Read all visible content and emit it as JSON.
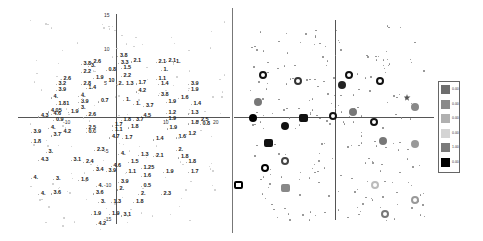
{
  "chart_data": [
    {
      "type": "scatter",
      "title": "",
      "xlabel": "",
      "ylabel": "",
      "xlim": [
        -20,
        22
      ],
      "ylim": [
        -17,
        17
      ],
      "grid": false,
      "x_ticks": [
        -10,
        10,
        20
      ],
      "y_ticks": [
        15,
        10,
        5,
        -5,
        -10,
        -15
      ],
      "points": [
        {
          "x": 0.8,
          "y": 15.5,
          "label": "3.8"
        },
        {
          "x": -6.5,
          "y": 13.5,
          "label": "3.8"
        },
        {
          "x": -4.5,
          "y": 14.0,
          "label": "2.6"
        },
        {
          "x": -5,
          "y": 13,
          "label": "3."
        },
        {
          "x": 1,
          "y": 13.8,
          "label": "3.3"
        },
        {
          "x": 3.5,
          "y": 14.2,
          "label": "2.1"
        },
        {
          "x": 8.5,
          "y": 14,
          "label": "2.1"
        },
        {
          "x": 10.5,
          "y": 14.3,
          "label": "2.1"
        },
        {
          "x": 12,
          "y": 14.1,
          "label": "1."
        },
        {
          "x": -6.5,
          "y": 11.5,
          "label": "2.2"
        },
        {
          "x": -1.5,
          "y": 12,
          "label": "0.8"
        },
        {
          "x": 1.5,
          "y": 12.5,
          "label": "1.5"
        },
        {
          "x": 9.5,
          "y": 12,
          "label": "1."
        },
        {
          "x": -10.5,
          "y": 9.8,
          "label": "2.6"
        },
        {
          "x": -4,
          "y": 10,
          "label": "1.9"
        },
        {
          "x": -1.5,
          "y": 9.3,
          "label": "10"
        },
        {
          "x": 1.5,
          "y": 10.5,
          "label": "2.2"
        },
        {
          "x": 8.5,
          "y": 9.8,
          "label": "1.1"
        },
        {
          "x": -11.5,
          "y": 8.5,
          "label": "3.2"
        },
        {
          "x": -6.5,
          "y": 8.5,
          "label": "2.8"
        },
        {
          "x": -5.5,
          "y": 7.5,
          "label": "1.4"
        },
        {
          "x": 0.5,
          "y": 8.6,
          "label": "2."
        },
        {
          "x": 2,
          "y": 8.5,
          "label": "1.3"
        },
        {
          "x": 4.5,
          "y": 8.7,
          "label": "1.7"
        },
        {
          "x": 9,
          "y": 8.5,
          "label": "1.4"
        },
        {
          "x": 15,
          "y": 8.5,
          "label": "3.9"
        },
        {
          "x": -11.5,
          "y": 7,
          "label": "3.9"
        },
        {
          "x": 4.5,
          "y": 6.7,
          "label": "4.2"
        },
        {
          "x": 15,
          "y": 7,
          "label": "1.9"
        },
        {
          "x": -12.5,
          "y": 5.2,
          "label": "4."
        },
        {
          "x": -7,
          "y": 5.5,
          "label": "4."
        },
        {
          "x": 9,
          "y": 5.8,
          "label": "3.8"
        },
        {
          "x": 13,
          "y": 5,
          "label": "1.6"
        },
        {
          "x": -11.5,
          "y": 3.5,
          "label": "1.81"
        },
        {
          "x": -7,
          "y": 4,
          "label": "3.9"
        },
        {
          "x": -3,
          "y": 4.2,
          "label": "0.7"
        },
        {
          "x": 2,
          "y": 4.5,
          "label": "1."
        },
        {
          "x": 4,
          "y": 3.5,
          "label": "1."
        },
        {
          "x": 6,
          "y": 3,
          "label": "3.7"
        },
        {
          "x": 10.5,
          "y": 4,
          "label": "1.9"
        },
        {
          "x": 15.5,
          "y": 3.5,
          "label": "1.4"
        },
        {
          "x": -7,
          "y": 2.5,
          "label": "3."
        },
        {
          "x": -13,
          "y": 1.7,
          "label": "4.05"
        },
        {
          "x": -9,
          "y": 1.5,
          "label": "1.9"
        },
        {
          "x": -12.5,
          "y": 1.0,
          "label": "4.6"
        },
        {
          "x": -5.5,
          "y": 0.8,
          "label": "2.6"
        },
        {
          "x": 5.5,
          "y": 0.5,
          "label": "4.5"
        },
        {
          "x": 10.5,
          "y": 1.3,
          "label": "1.2"
        },
        {
          "x": 15,
          "y": 1.2,
          "label": "1.3"
        },
        {
          "x": -15,
          "y": 0.4,
          "label": "4.3"
        },
        {
          "x": -12,
          "y": -0.5,
          "label": "0.9"
        },
        {
          "x": 1.5,
          "y": -0.5,
          "label": "1.8"
        },
        {
          "x": 4,
          "y": -0.5,
          "label": "3.7"
        },
        {
          "x": 10.5,
          "y": -0.3,
          "label": "1.9"
        },
        {
          "x": 17,
          "y": -0.6,
          "label": "2.5"
        },
        {
          "x": 15,
          "y": -1.3,
          "label": "1.8"
        },
        {
          "x": 17.3,
          "y": -1.5,
          "label": "0.8"
        },
        {
          "x": -0.2,
          "y": -1.8,
          "label": "1.7"
        },
        {
          "x": -13,
          "y": -2.5,
          "label": "4."
        },
        {
          "x": -5.5,
          "y": -2.5,
          "label": "2.5"
        },
        {
          "x": 3,
          "y": -2.3,
          "label": "1.8"
        },
        {
          "x": 10.7,
          "y": -2.6,
          "label": "1.9"
        },
        {
          "x": -16.5,
          "y": -3.5,
          "label": "3.9"
        },
        {
          "x": -10.5,
          "y": -3.5,
          "label": "4.2"
        },
        {
          "x": -5.5,
          "y": -3.5,
          "label": "0.6"
        },
        {
          "x": -0.2,
          "y": -3,
          "label": "1.1"
        },
        {
          "x": 14.5,
          "y": -4,
          "label": "1.2"
        },
        {
          "x": -12.5,
          "y": -4.3,
          "label": "3.7"
        },
        {
          "x": -0.8,
          "y": -4.8,
          "label": "4.7"
        },
        {
          "x": 1.8,
          "y": -5,
          "label": "1.7"
        },
        {
          "x": 8,
          "y": -5.3,
          "label": "1.4"
        },
        {
          "x": 12.5,
          "y": -4.8,
          "label": "1.6"
        },
        {
          "x": -16.5,
          "y": -6,
          "label": "1.8"
        },
        {
          "x": -3.8,
          "y": -8,
          "label": "2.3"
        },
        {
          "x": 12.5,
          "y": -8,
          "label": "2."
        },
        {
          "x": -13.5,
          "y": -8.5,
          "label": "3."
        },
        {
          "x": 1,
          "y": -9,
          "label": "4."
        },
        {
          "x": 5,
          "y": -9.2,
          "label": "1.3"
        },
        {
          "x": 8,
          "y": -9.5,
          "label": "2.1"
        },
        {
          "x": 13,
          "y": -9.8,
          "label": "1.8"
        },
        {
          "x": -15,
          "y": -10.5,
          "label": "4.3"
        },
        {
          "x": -8.5,
          "y": -10.5,
          "label": "3.1"
        },
        {
          "x": -6,
          "y": -11,
          "label": "2.4"
        },
        {
          "x": 3,
          "y": -11,
          "label": "1.5"
        },
        {
          "x": 14.5,
          "y": -11,
          "label": "1.8"
        },
        {
          "x": -0.5,
          "y": -12,
          "label": "4.6"
        },
        {
          "x": 5.5,
          "y": -12.5,
          "label": "1.25"
        },
        {
          "x": -4,
          "y": -13,
          "label": "3.4"
        },
        {
          "x": -1.5,
          "y": -13.2,
          "label": "3.9"
        },
        {
          "x": 2.5,
          "y": -13.5,
          "label": "1.1"
        },
        {
          "x": 10,
          "y": -13.5,
          "label": "1.9"
        },
        {
          "x": 15,
          "y": -13.5,
          "label": "1.7"
        },
        {
          "x": 5.5,
          "y": -14.5,
          "label": "1.6"
        },
        {
          "x": -16.5,
          "y": -15,
          "label": "4."
        },
        {
          "x": -12,
          "y": -15.2,
          "label": "3."
        },
        {
          "x": -7,
          "y": -15.5,
          "label": "1.6"
        },
        {
          "x": 1,
          "y": -16,
          "label": "3.9"
        },
        {
          "x": -3.5,
          "y": -17,
          "label": "4."
        },
        {
          "x": 5.5,
          "y": -17,
          "label": "0.5"
        },
        {
          "x": 0.7,
          "y": -17.8,
          "label": "2."
        },
        {
          "x": -15,
          "y": -19,
          "label": "4."
        },
        {
          "x": -12.5,
          "y": -18.8,
          "label": "3.6"
        },
        {
          "x": -4,
          "y": -18.8,
          "label": "3.6"
        },
        {
          "x": 5,
          "y": -19,
          "label": "2."
        },
        {
          "x": 9.5,
          "y": -19,
          "label": "2.3"
        },
        {
          "x": -3,
          "y": -21,
          "label": "3."
        },
        {
          "x": -0.5,
          "y": -21,
          "label": "1.3"
        },
        {
          "x": 4,
          "y": -21,
          "label": "1.8"
        },
        {
          "x": -4.5,
          "y": -24,
          "label": "1.9"
        },
        {
          "x": -0.8,
          "y": -24,
          "label": "1.9"
        },
        {
          "x": 1.5,
          "y": -24.3,
          "label": "3.1"
        },
        {
          "x": -3.5,
          "y": -26.5,
          "label": "4.2"
        }
      ]
    },
    {
      "type": "scatter",
      "title": "",
      "xlabel": "",
      "ylabel": "",
      "grid": false,
      "legend_position": "right",
      "legend": {
        "entries": [
          {
            "label": "0.00",
            "color": "#6e6e6e"
          },
          {
            "label": "0.00",
            "color": "#8a8a8a"
          },
          {
            "label": "0.00",
            "color": "#b0b0b0"
          },
          {
            "label": "0.00",
            "color": "#d4d4d4"
          },
          {
            "label": "1.00",
            "color": "#7a7a7a"
          },
          {
            "label": "0.00",
            "color": "#000000"
          }
        ]
      },
      "markers": [
        {
          "x": -14.5,
          "y": 12.5,
          "shape": "ring",
          "color": "#111"
        },
        {
          "x": -7.5,
          "y": 10.7,
          "shape": "ring",
          "color": "#333"
        },
        {
          "x": 2.8,
          "y": 12.5,
          "shape": "ring",
          "color": "#111"
        },
        {
          "x": 9,
          "y": 10.5,
          "shape": "ring",
          "color": "#111"
        },
        {
          "x": 1.3,
          "y": 9.5,
          "shape": "disc",
          "color": "#222"
        },
        {
          "x": 14.5,
          "y": 5.6,
          "shape": "star",
          "color": "#555"
        },
        {
          "x": -15.5,
          "y": 4.5,
          "shape": "disc",
          "color": "#777"
        },
        {
          "x": 16,
          "y": 3,
          "shape": "disc",
          "color": "#888"
        },
        {
          "x": -0.5,
          "y": 0.3,
          "shape": "ring",
          "color": "#111"
        },
        {
          "x": 3.5,
          "y": 1.5,
          "shape": "disc",
          "color": "#777"
        },
        {
          "x": -16.5,
          "y": -0.3,
          "shape": "disc",
          "color": "#000"
        },
        {
          "x": -6.5,
          "y": -0.2,
          "shape": "square",
          "color": "#111"
        },
        {
          "x": 7.8,
          "y": -1.5,
          "shape": "ring",
          "color": "#111"
        },
        {
          "x": -10,
          "y": -2.5,
          "shape": "disc",
          "color": "#111"
        },
        {
          "x": -13.5,
          "y": -7.5,
          "shape": "square",
          "color": "#111"
        },
        {
          "x": 9.5,
          "y": -7,
          "shape": "disc",
          "color": "#777"
        },
        {
          "x": 16,
          "y": -8,
          "shape": "disc",
          "color": "#999"
        },
        {
          "x": -10,
          "y": -13,
          "shape": "ring",
          "color": "#444"
        },
        {
          "x": -14,
          "y": -15,
          "shape": "ring",
          "color": "#000"
        },
        {
          "x": -19.5,
          "y": -20,
          "shape": "square",
          "color": "#000"
        },
        {
          "x": -10,
          "y": -21,
          "shape": "square",
          "color": "#888"
        },
        {
          "x": 8,
          "y": -20,
          "shape": "ring",
          "color": "#bbb"
        },
        {
          "x": 16,
          "y": -24.5,
          "shape": "ring",
          "color": "#999"
        },
        {
          "x": 10,
          "y": -28.5,
          "shape": "ring",
          "color": "#777"
        }
      ]
    }
  ]
}
